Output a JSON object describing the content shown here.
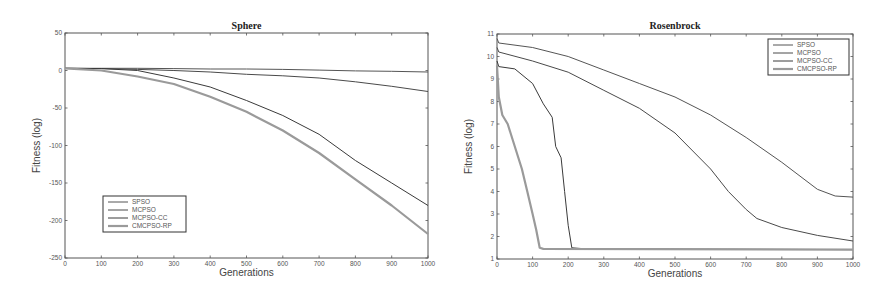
{
  "chart_data": [
    {
      "type": "line",
      "title": "Sphere",
      "xlabel": "Generations",
      "ylabel": "Fitness (log)",
      "xlim": [
        0,
        1000
      ],
      "ylim": [
        -250,
        50
      ],
      "xticks": [
        0,
        100,
        200,
        300,
        400,
        500,
        600,
        700,
        800,
        900,
        1000
      ],
      "yticks": [
        50,
        0,
        -50,
        -100,
        -150,
        -200,
        -250
      ],
      "grid": false,
      "legend_position": "lower left",
      "x": [
        0,
        100,
        200,
        300,
        400,
        500,
        600,
        700,
        800,
        900,
        1000
      ],
      "series": [
        {
          "name": "SPSO",
          "values": [
            3,
            3,
            3,
            2.5,
            2,
            2,
            1.5,
            0.5,
            -0.5,
            -1,
            -2
          ]
        },
        {
          "name": "MCPSO",
          "values": [
            3,
            2.5,
            1.5,
            0,
            -2,
            -5,
            -7,
            -10,
            -15,
            -21,
            -28
          ]
        },
        {
          "name": "MCPSO-CC",
          "values": [
            3,
            2.5,
            0,
            -10,
            -22,
            -40,
            -60,
            -85,
            -120,
            -150,
            -180
          ]
        },
        {
          "name": "CMCPSO-RP",
          "values": [
            3,
            0,
            -8,
            -18,
            -35,
            -55,
            -80,
            -110,
            -145,
            -180,
            -218
          ]
        }
      ]
    },
    {
      "type": "line",
      "title": "Rosenbrock",
      "xlabel": "Generations",
      "ylabel": "Fitness (log)",
      "xlim": [
        0,
        1000
      ],
      "ylim": [
        1,
        11
      ],
      "xticks": [
        0,
        100,
        200,
        300,
        400,
        500,
        600,
        700,
        800,
        900,
        1000
      ],
      "yticks": [
        1,
        2,
        3,
        4,
        5,
        6,
        7,
        8,
        9,
        10,
        11
      ],
      "grid": false,
      "legend_position": "upper right",
      "series": [
        {
          "name": "SPSO",
          "x": [
            0,
            5,
            100,
            200,
            300,
            400,
            500,
            600,
            700,
            800,
            900,
            950,
            1000
          ],
          "values": [
            10.8,
            10.6,
            10.4,
            10.0,
            9.4,
            8.8,
            8.2,
            7.4,
            6.4,
            5.3,
            4.1,
            3.8,
            3.75
          ]
        },
        {
          "name": "MCPSO",
          "x": [
            0,
            5,
            100,
            200,
            300,
            400,
            500,
            600,
            650,
            700,
            730,
            800,
            900,
            1000
          ],
          "values": [
            10.4,
            10.2,
            9.8,
            9.3,
            8.5,
            7.7,
            6.6,
            5.0,
            4.0,
            3.2,
            2.8,
            2.4,
            2.05,
            1.8
          ]
        },
        {
          "name": "MCPSO-CC",
          "x": [
            0,
            5,
            50,
            100,
            130,
            155,
            165,
            180,
            190,
            200,
            210,
            250,
            1000
          ],
          "values": [
            9.8,
            9.55,
            9.45,
            8.8,
            7.9,
            7.3,
            6.0,
            5.5,
            4.0,
            2.5,
            1.5,
            1.45,
            1.42
          ]
        },
        {
          "name": "CMCPSO-RP",
          "x": [
            0,
            5,
            15,
            30,
            50,
            70,
            85,
            100,
            110,
            120,
            130,
            1000
          ],
          "values": [
            9.6,
            8.2,
            7.4,
            7.0,
            6.0,
            5.0,
            4.0,
            3.0,
            2.3,
            1.5,
            1.45,
            1.42
          ]
        }
      ]
    }
  ],
  "styles": {
    "axis_color": "#555555",
    "line_colors": [
      "#555555",
      "#4a4a4a",
      "#3a3a3a",
      "#9a9a9a"
    ],
    "line_widths": [
      1,
      1,
      1,
      2.2
    ]
  }
}
